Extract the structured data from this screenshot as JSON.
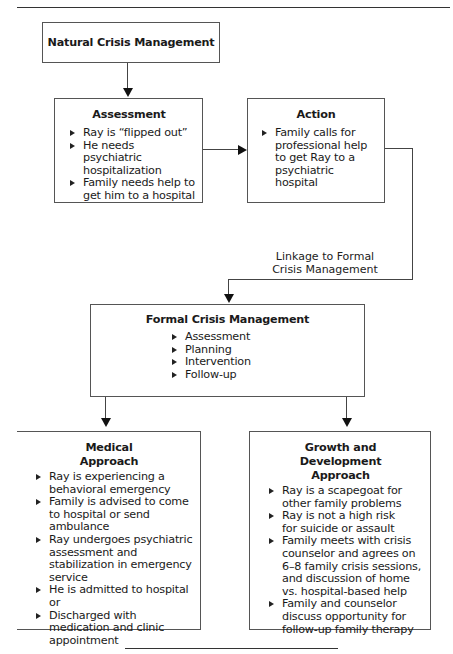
{
  "natural": {
    "title": "Natural Crisis Management"
  },
  "assessment": {
    "title": "Assessment",
    "items": [
      "Ray is “flipped out”",
      "He needs psychiatric hospitalization",
      "Family needs help to get him to a hospital"
    ]
  },
  "action": {
    "title": "Action",
    "items": [
      "Family calls for professional help to get Ray to a psychiatric hospital"
    ]
  },
  "linkage": {
    "line1": "Linkage to Formal",
    "line2": "Crisis Management"
  },
  "formal": {
    "title": "Formal Crisis Management",
    "items": [
      "Assessment",
      "Planning",
      "Intervention",
      "Follow-up"
    ]
  },
  "medical": {
    "title_line1": "Medical",
    "title_line2": "Approach",
    "items": [
      "Ray is experiencing a behavioral emergency",
      "Family is advised to come to hospital or send ambulance",
      "Ray undergoes psychiatric assessment and stabilization in emergency service",
      "He is admitted to hospital or",
      "Discharged with medication and clinic appointment"
    ]
  },
  "growth": {
    "title_line1": "Growth and Development",
    "title_line2": "Approach",
    "items": [
      "Ray is a scapegoat for other family problems",
      "Ray is not a high risk for suicide or assault",
      "Family meets with crisis counselor and agrees on 6–8 family crisis sessions, and discussion of home vs. hospital-based help",
      "Family and counselor discuss opportunity for follow-up family therapy"
    ]
  }
}
